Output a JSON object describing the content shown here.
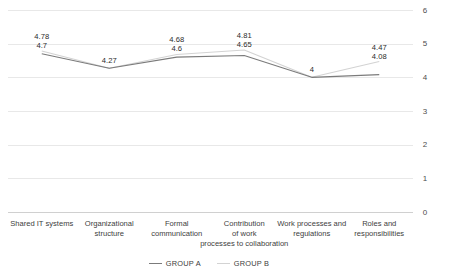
{
  "chart_data": {
    "type": "line",
    "title": "",
    "xlabel": "",
    "ylabel": "",
    "ylim": [
      0,
      6
    ],
    "grid": true,
    "legend_position": "bottom",
    "y_ticks": [
      "0",
      "1",
      "2",
      "3",
      "4",
      "5",
      "6"
    ],
    "categories": [
      "Shared IT systems",
      "Organizational structure",
      "Formal communication",
      "Contribution of work processes to collaboration",
      "Work processes and regulations",
      "Roles and responsibilities"
    ],
    "category_lines": [
      [
        "Shared IT systems"
      ],
      [
        "Organizational",
        "structure"
      ],
      [
        "Formal",
        "communication"
      ],
      [
        "Contribution",
        "of work",
        "processes to collaboration"
      ],
      [
        "Work processes and",
        "regulations"
      ],
      [
        "Roles and",
        "responsibilities"
      ]
    ],
    "series": [
      {
        "name": "GROUP  A",
        "color": "#7b7b7b",
        "values": [
          4.7,
          4.27,
          4.6,
          4.65,
          4,
          4.08
        ],
        "labels": [
          "4.7",
          "4.27",
          "4.6",
          "4.65",
          "4",
          "4.08"
        ]
      },
      {
        "name": "GROUP B",
        "color": "#d3d3d3",
        "values": [
          4.78,
          4.27,
          4.68,
          4.81,
          4,
          4.47
        ],
        "labels": [
          "4.78",
          "4.27",
          "4.68",
          "4.81",
          "4",
          "4.47"
        ]
      }
    ]
  },
  "legend": {
    "items": [
      {
        "label": "GROUP  A",
        "color": "#7b7b7b"
      },
      {
        "label": "GROUP B",
        "color": "#d3d3d3"
      }
    ]
  }
}
